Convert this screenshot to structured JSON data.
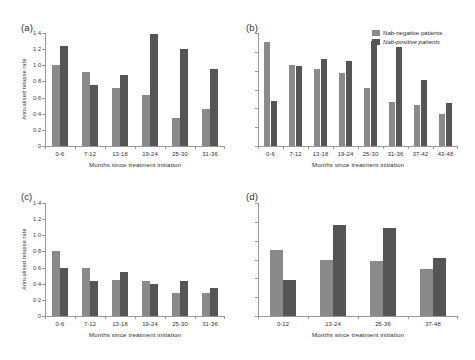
{
  "figure": {
    "legend": {
      "series": [
        {
          "label": "Nab-negative patients",
          "color": "#8a8a8a"
        },
        {
          "label": "Nab-positive patients",
          "color": "#555555"
        }
      ]
    },
    "colors": {
      "negative": "#8a8a8a",
      "positive": "#555555",
      "axis": "#9a9a9a"
    }
  },
  "chart_data": [
    {
      "type": "bar",
      "panel": "(a)",
      "title": "",
      "xlabel": "Months since treatment initiation",
      "ylabel": "Annualised relapse rate",
      "categories": [
        "0-6",
        "7-12",
        "13-18",
        "19-24",
        "25-30",
        "31-36"
      ],
      "series": [
        {
          "name": "Nab-negative patients",
          "values": [
            1.0,
            0.92,
            0.72,
            0.63,
            0.35,
            0.46
          ]
        },
        {
          "name": "Nab-positive patients",
          "values": [
            1.24,
            0.76,
            0.88,
            1.39,
            1.2,
            0.96
          ]
        }
      ],
      "ylim": [
        0,
        1.4
      ],
      "yticks": [
        0,
        0.2,
        0.4,
        0.6,
        0.8,
        1.0,
        1.2,
        1.4
      ],
      "ytick_labels": [
        "0",
        "0·2",
        "0·4",
        "0·6",
        "0·8",
        "1·0",
        "1·2",
        "1·4"
      ],
      "grid": false,
      "legend_position": "none"
    },
    {
      "type": "bar",
      "panel": "(b)",
      "title": "",
      "xlabel": "Months since treatment initiation",
      "ylabel": "",
      "categories": [
        "0-6",
        "7-12",
        "13-18",
        "19-24",
        "25-30",
        "31-36",
        "37-42",
        "43-48"
      ],
      "series": [
        {
          "name": "Nab-negative patients",
          "values": [
            1.1,
            0.86,
            0.82,
            0.78,
            0.62,
            0.47,
            0.44,
            0.34
          ]
        },
        {
          "name": "Nab-positive patients",
          "values": [
            0.48,
            0.85,
            0.92,
            0.9,
            1.12,
            1.05,
            0.7,
            0.46
          ]
        }
      ],
      "ylim": [
        0,
        1.2
      ],
      "yticks": [
        0,
        0.2,
        0.4,
        0.6,
        0.8,
        1.0,
        1.2
      ],
      "ytick_labels": [
        "",
        "",
        "",
        "",
        "",
        "",
        ""
      ],
      "grid": false,
      "legend_position": "top-right"
    },
    {
      "type": "bar",
      "panel": "(c)",
      "title": "",
      "xlabel": "Months since treatment initiation",
      "ylabel": "Annualised relapse rate",
      "categories": [
        "0-6",
        "7-12",
        "13-18",
        "19-24",
        "25-30",
        "31-36"
      ],
      "series": [
        {
          "name": "Nab-negative patients",
          "values": [
            0.81,
            0.59,
            0.45,
            0.435,
            0.29,
            0.28
          ]
        },
        {
          "name": "Nab-positive patients",
          "values": [
            0.6,
            0.44,
            0.54,
            0.4,
            0.44,
            0.35
          ]
        }
      ],
      "ylim": [
        0,
        1.4
      ],
      "yticks": [
        0,
        0.2,
        0.4,
        0.6,
        0.8,
        1.0,
        1.2,
        1.4
      ],
      "ytick_labels": [
        "0",
        "0·2",
        "0·4",
        "0·6",
        "0·8",
        "1·0",
        "1·2",
        "1·4"
      ],
      "grid": false,
      "legend_position": "none"
    },
    {
      "type": "bar",
      "panel": "(d)",
      "title": "",
      "xlabel": "Months since treatment initiation",
      "ylabel": "",
      "categories": [
        "0-12",
        "13-24",
        "25-36",
        "37-48"
      ],
      "series": [
        {
          "name": "Nab-negative patients",
          "values": [
            0.7,
            0.6,
            0.58,
            0.5
          ]
        },
        {
          "name": "Nab-positive patients",
          "values": [
            0.38,
            0.97,
            0.93,
            0.62
          ]
        }
      ],
      "ylim": [
        0,
        1.2
      ],
      "yticks": [
        0,
        0.2,
        0.4,
        0.6,
        0.8,
        1.0,
        1.2
      ],
      "ytick_labels": [
        "",
        "",
        "",
        "",
        "",
        "",
        ""
      ],
      "grid": false,
      "legend_position": "none"
    }
  ]
}
